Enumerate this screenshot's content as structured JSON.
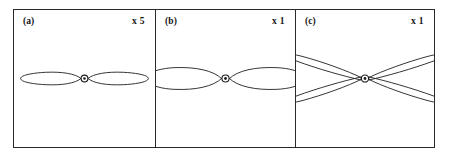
{
  "figure": {
    "type": "antenna-radiation-pattern-figure",
    "panel_count": 3,
    "frame_color": "#2a2a2a",
    "curve_color": "#1c1c1c",
    "background": "#ffffff"
  },
  "panels": [
    {
      "id": "a",
      "label": "(a)",
      "scale_label": "x 5",
      "scale_factor": 5,
      "pattern": "narrow horizontal figure-eight, two thin lobes along the horizontal axis",
      "lobe_count": 2,
      "center_marker": "small circle with dot"
    },
    {
      "id": "b",
      "label": "(b)",
      "scale_label": "x 1",
      "scale_factor": 1,
      "pattern": "broad horizontal figure-eight, two wide lobes extending past panel edges",
      "lobe_count": 2,
      "center_marker": "small circle with dot"
    },
    {
      "id": "c",
      "label": "(c)",
      "scale_label": "x 1",
      "scale_factor": 1,
      "pattern": "four narrow lobes forming an X, tilted off the horizontal axis",
      "lobe_count": 4,
      "center_marker": "small circle with dot"
    }
  ]
}
